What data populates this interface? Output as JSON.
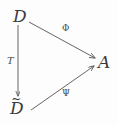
{
  "diagram": {
    "type": "commutative-triangle",
    "background_color": "#fdfdfd",
    "stroke_color": "#555555",
    "text_color": "#3b3b3b",
    "vertices": [
      {
        "id": "D",
        "label": "D",
        "accent": "",
        "position": "top-left"
      },
      {
        "id": "Dtilde",
        "label": "D",
        "accent": "~",
        "position": "bottom-left"
      },
      {
        "id": "A",
        "label": "A",
        "accent": "",
        "position": "right"
      }
    ],
    "arrows": [
      {
        "id": "phi",
        "label": "Φ",
        "from": "D",
        "to": "A",
        "style": "diagonal-down-right"
      },
      {
        "id": "T",
        "label": "T",
        "from": "D",
        "to": "Dtilde",
        "style": "vertical-down"
      },
      {
        "id": "psi",
        "label": "Ψ",
        "from": "Dtilde",
        "to": "A",
        "style": "diagonal-up-right"
      }
    ]
  }
}
